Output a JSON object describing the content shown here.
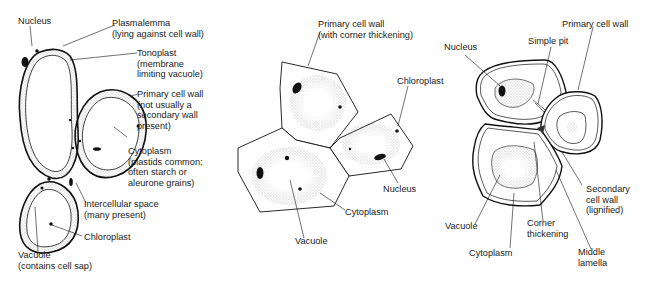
{
  "diagram": {
    "panels": [
      {
        "name": "parenchyma",
        "labels": {
          "nucleus": "Nucleus",
          "plasmalemma": "Plasmalemma\n(lying against cell wall)",
          "tonoplast": "Tonoplast\n(membrane\nlimiting vacuole)",
          "primary_wall": "Primary cell wall\n(not usually a\nsecondary wall\npresent)",
          "cytoplasm": "Cytoplasm\n(plastids common;\noften starch or\naleurone grains)",
          "intercellular": "Intercellular space\n(many present)",
          "chloroplast": "Chloroplast",
          "vacuole": "Vacuole\n(contains cell sap)"
        }
      },
      {
        "name": "collenchyma",
        "labels": {
          "primary_wall": "Primary cell wall\n(with corner thickening)",
          "chloroplast": "Chloroplast",
          "nucleus": "Nucleus",
          "cytoplasm": "Cytoplasm",
          "vacuole": "Vacuole"
        }
      },
      {
        "name": "sclerenchyma",
        "labels": {
          "nucleus": "Nucleus",
          "simple_pit": "Simple pit",
          "primary_wall": "Primary cell wall",
          "secondary_wall": "Secondary\ncell wall\n(lignified)",
          "vacuole": "Vacuole",
          "corner": "Corner\nthickening",
          "cytoplasm": "Cytoplasm",
          "middle_lamella": "Middle\nlamella"
        }
      }
    ]
  }
}
